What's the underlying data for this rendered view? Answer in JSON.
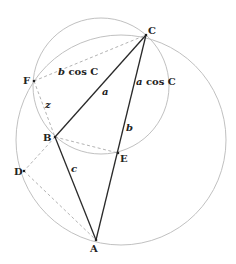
{
  "diagram": {
    "points": {
      "A": {
        "label": "A",
        "x": 96,
        "y": 240
      },
      "B": {
        "label": "B",
        "x": 55,
        "y": 137
      },
      "C": {
        "label": "C",
        "x": 146,
        "y": 35
      },
      "D": {
        "label": "D",
        "x": 24,
        "y": 171
      },
      "E": {
        "label": "E",
        "x": 118,
        "y": 153
      },
      "F": {
        "label": "F",
        "x": 34,
        "y": 81
      }
    },
    "circles": [
      {
        "name": "circumcircle-ABC",
        "cx": 121,
        "cy": 140,
        "r": 105
      },
      {
        "name": "circle-CFBE",
        "cx": 101,
        "cy": 86,
        "r": 68
      }
    ],
    "labels": {
      "side_a": "a",
      "side_b": "b",
      "side_c": "c",
      "segment_z": "z",
      "b_cos_C": {
        "var": "b",
        "rest": " cos C"
      },
      "a_cos_C": {
        "var": "a",
        "rest": " cos C"
      }
    },
    "colors": {
      "circle": "#b9b9b9",
      "side": "#2a2a2a",
      "dashed": "#aaaaaa",
      "text": "#222222"
    }
  }
}
